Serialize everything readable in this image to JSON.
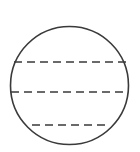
{
  "figure": {
    "width": 140,
    "height": 152,
    "background": "#ffffff",
    "stroke_color": "#3a3a3a",
    "circle": {
      "cx": 69.5,
      "cy": 85.5,
      "r": 59,
      "stroke_width": 1.6
    },
    "dashed_lines": [
      {
        "y": 62,
        "x1": 14,
        "x2": 126,
        "dash": "8 5"
      },
      {
        "y": 92,
        "x1": 11,
        "x2": 128,
        "dash": "8 5"
      },
      {
        "y": 125,
        "x1": 32,
        "x2": 107,
        "dash": "8 5"
      }
    ]
  }
}
